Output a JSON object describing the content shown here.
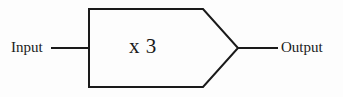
{
  "diagram": {
    "type": "block-diagram",
    "background_color": "#fdfdfd",
    "stroke_color": "#1a1a1a",
    "stroke_width": 2,
    "canvas": {
      "width": 343,
      "height": 97
    },
    "block": {
      "name": "multiplier-block",
      "shape": "pentagon-arrow",
      "label": "x 3",
      "operation": "multiply",
      "gain": 3,
      "vertices": [
        {
          "x": 89,
          "y": 9
        },
        {
          "x": 203,
          "y": 9
        },
        {
          "x": 238,
          "y": 48
        },
        {
          "x": 203,
          "y": 87
        },
        {
          "x": 89,
          "y": 87
        }
      ],
      "fill": "none"
    },
    "ports": [
      {
        "name": "input-port",
        "label": "Input",
        "direction": "in",
        "line": {
          "x1": 52,
          "y1": 48,
          "x2": 89,
          "y2": 48
        },
        "label_x": 11,
        "label_y": 40
      },
      {
        "name": "output-port",
        "label": "Output",
        "direction": "out",
        "line": {
          "x1": 238,
          "y1": 48,
          "x2": 277,
          "y2": 48
        },
        "label_x": 281,
        "label_y": 40
      }
    ]
  }
}
